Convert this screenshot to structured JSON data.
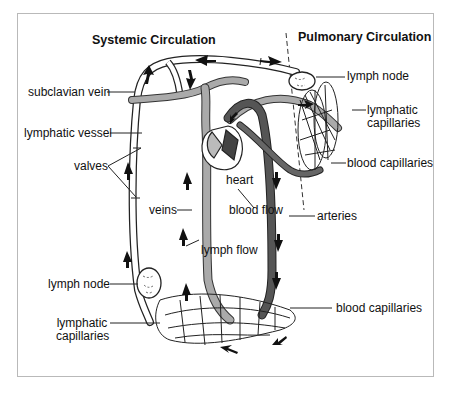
{
  "titles": {
    "systemic": "Systemic Circulation",
    "pulmonary": "Pulmonary Circulation"
  },
  "labels": {
    "subclavian_vein": "subclavian vein",
    "lymphatic_vessel": "lymphatic vessel",
    "valves": "valves",
    "veins": "veins",
    "heart": "heart",
    "blood_flow": "blood flow",
    "arteries": "arteries",
    "lymph_flow": "lymph flow",
    "lymph_node_left": "lymph node",
    "lymphatic_capillaries_left_1": "lymphatic",
    "lymphatic_capillaries_left_2": "capillaries",
    "blood_capillaries_bottom": "blood capillaries",
    "lymph_node_right": "lymph node",
    "lymphatic_capillaries_right_1": "lymphatic",
    "lymphatic_capillaries_right_2": "capillaries",
    "blood_capillaries_right": "blood capillaries"
  },
  "colors": {
    "vein": "#a9a9a9",
    "artery": "#555555",
    "lymph": "#ffffff",
    "outline": "#222222"
  }
}
